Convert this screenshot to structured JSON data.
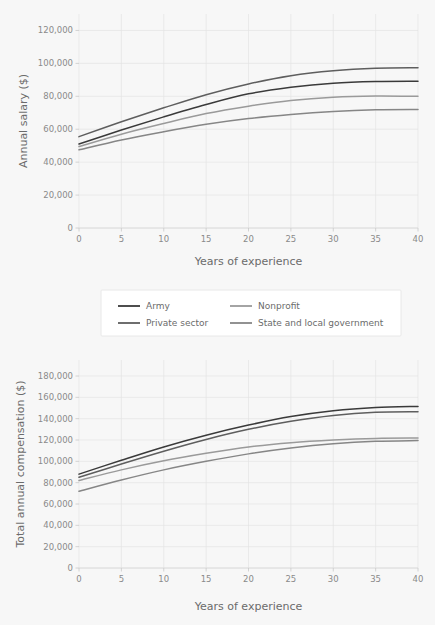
{
  "background_color": "#f7f7f7",
  "legend": {
    "position": "between-panels",
    "entries": [
      {
        "label": "Army",
        "color": "#3a3a3a",
        "row": 0,
        "col": 0
      },
      {
        "label": "Nonprofit",
        "color": "#9a9a9a",
        "row": 0,
        "col": 1
      },
      {
        "label": "Private sector",
        "color": "#5e5e5e",
        "row": 1,
        "col": 0
      },
      {
        "label": "State and local government",
        "color": "#868686",
        "row": 1,
        "col": 1
      }
    ]
  },
  "chart_data": [
    {
      "id": "annual-salary",
      "type": "line",
      "title": "",
      "xlabel": "Years of experience",
      "ylabel": "Annual salary ($)",
      "xlim": [
        0,
        40
      ],
      "ylim": [
        0,
        130000
      ],
      "xticks": [
        0,
        5,
        10,
        15,
        20,
        25,
        30,
        35,
        40
      ],
      "xtick_labels": [
        "0",
        "5",
        "10",
        "15",
        "20",
        "25",
        "30",
        "35",
        "40"
      ],
      "yticks": [
        0,
        20000,
        40000,
        60000,
        80000,
        100000,
        120000
      ],
      "ytick_labels": [
        "0",
        "20,000",
        "40,000",
        "60,000",
        "80,000",
        "100,000",
        "120,000"
      ],
      "grid": true,
      "x": [
        0,
        5,
        10,
        15,
        20,
        25,
        30,
        35,
        40
      ],
      "series": [
        {
          "name": "Army",
          "color": "#3a3a3a",
          "values": [
            51000,
            59500,
            67500,
            75000,
            81500,
            85500,
            88000,
            89000,
            89200
          ]
        },
        {
          "name": "Private sector",
          "color": "#5e5e5e",
          "values": [
            55500,
            64500,
            73000,
            81000,
            87500,
            92500,
            95500,
            97000,
            97300
          ]
        },
        {
          "name": "Nonprofit",
          "color": "#9a9a9a",
          "values": [
            49500,
            57000,
            63500,
            69500,
            74000,
            77500,
            79500,
            80200,
            80000
          ]
        },
        {
          "name": "State and local government",
          "color": "#868686",
          "values": [
            47500,
            53500,
            58500,
            63000,
            66500,
            69000,
            70800,
            71800,
            72000
          ]
        }
      ]
    },
    {
      "id": "total-annual-compensation",
      "type": "line",
      "title": "",
      "xlabel": "Years of experience",
      "ylabel": "Total annual compensation ($)",
      "xlim": [
        0,
        40
      ],
      "ylim": [
        0,
        195000
      ],
      "xticks": [
        0,
        5,
        10,
        15,
        20,
        25,
        30,
        35,
        40
      ],
      "xtick_labels": [
        "0",
        "5",
        "10",
        "15",
        "20",
        "25",
        "30",
        "35",
        "40"
      ],
      "yticks": [
        0,
        20000,
        40000,
        60000,
        80000,
        100000,
        120000,
        140000,
        160000,
        180000
      ],
      "ytick_labels": [
        "0",
        "20,000",
        "40,000",
        "60,000",
        "80,000",
        "100,000",
        "120,000",
        "140,000",
        "160,000",
        "180,000"
      ],
      "grid": true,
      "x": [
        0,
        5,
        10,
        15,
        20,
        25,
        30,
        35,
        40
      ],
      "series": [
        {
          "name": "Army",
          "color": "#3a3a3a",
          "values": [
            88000,
            101000,
            113500,
            124500,
            134000,
            142000,
            147500,
            150500,
            151500
          ]
        },
        {
          "name": "Private sector",
          "color": "#5e5e5e",
          "values": [
            85000,
            97500,
            109500,
            120500,
            130000,
            137500,
            143000,
            146000,
            146500
          ]
        },
        {
          "name": "Nonprofit",
          "color": "#9a9a9a",
          "values": [
            82000,
            92000,
            100500,
            107500,
            113500,
            117500,
            120000,
            121500,
            121800
          ]
        },
        {
          "name": "State and local government",
          "color": "#868686",
          "values": [
            72000,
            82500,
            92000,
            100000,
            107000,
            112500,
            116500,
            118800,
            119500
          ]
        }
      ]
    }
  ]
}
